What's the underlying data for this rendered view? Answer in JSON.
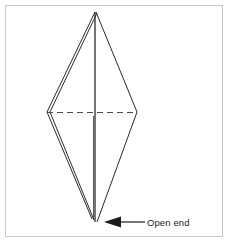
{
  "figure": {
    "type": "origami-fold-diagram",
    "frame": {
      "stroke_color": "#c9c9c9",
      "fill_color": "#ffffff",
      "x": 5,
      "y": 5,
      "width": 218,
      "height": 232
    },
    "line_color": "#2b2b2b",
    "dashed_line_color": "#4a4a4a",
    "shape": {
      "name": "elongated-diamond",
      "top_apex": {
        "x": 95,
        "y": 12
      },
      "bottom_apex": {
        "x": 96,
        "y": 222
      },
      "left_vertex": {
        "x": 47,
        "y": 112
      },
      "right_vertex": {
        "x": 137,
        "y": 112
      },
      "layer_offset_px": 3,
      "layers": 2
    },
    "center_line": {
      "name": "vertical-center-crease",
      "x": 95,
      "y_top": 12,
      "y_bottom": 222
    },
    "fold_line": {
      "name": "horizontal-fold-crease",
      "style": "dashed",
      "dash_pattern": "6 4",
      "x_start": 47,
      "x_end": 137,
      "y": 112
    },
    "annotations": [
      {
        "id": "open-end",
        "label": "Open end",
        "arrow": {
          "direction": "left",
          "tip_x": 104,
          "tip_y": 222,
          "tail_x": 145,
          "tail_y": 222,
          "head_length": 16,
          "head_half_width": 5
        },
        "text_x": 147,
        "text_y": 226,
        "color": "#1a1a1a"
      }
    ]
  }
}
